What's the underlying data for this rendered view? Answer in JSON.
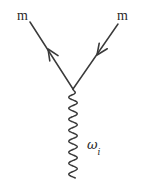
{
  "figure": {
    "kind": "feynman-diagram",
    "background_color": "#ffffff",
    "stroke_color": "#3a3a3a",
    "width": 143,
    "height": 184,
    "labels": {
      "left_particle": "m",
      "right_particle": "m",
      "boson_symbol": "ω",
      "boson_subscript": "i"
    },
    "geometry": {
      "vertex": {
        "x": 73,
        "y": 89
      },
      "left_leg": {
        "x1": 30,
        "y1": 22,
        "x2": 73,
        "y2": 89
      },
      "right_leg": {
        "x1": 118,
        "y1": 24,
        "x2": 73,
        "y2": 89
      },
      "left_arrow": {
        "x": 48,
        "y": 49,
        "direction": "up-left"
      },
      "right_arrow": {
        "x": 97,
        "y": 55,
        "direction": "down-left"
      },
      "wave": {
        "x_center": 73,
        "y_start": 89,
        "y_end": 178,
        "amplitude": 4.2,
        "period": 11
      }
    }
  }
}
